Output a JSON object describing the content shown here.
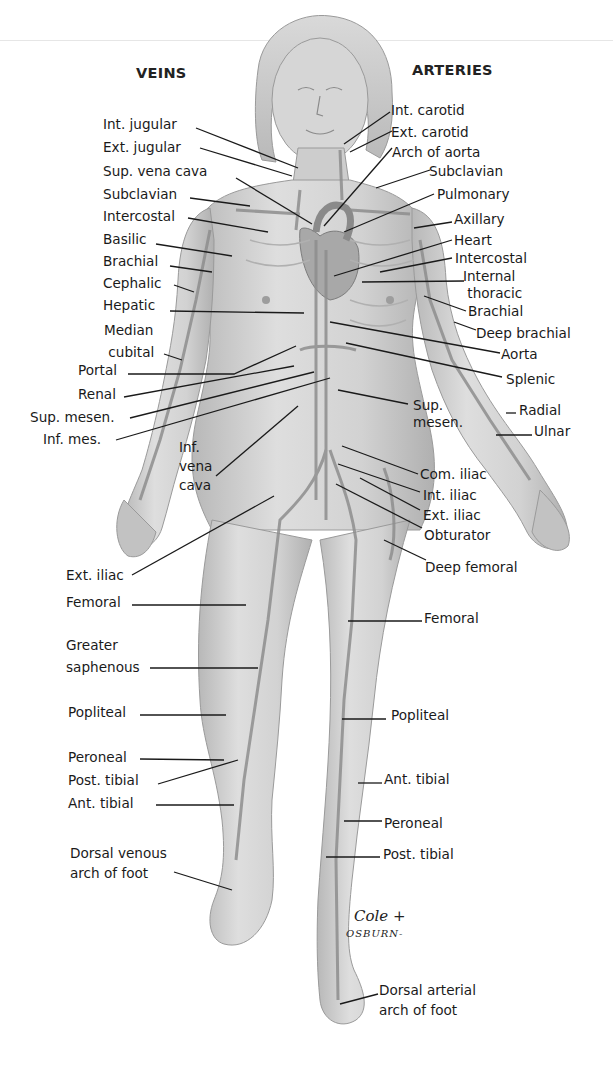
{
  "headers": {
    "veins": "VEINS",
    "arteries": "ARTERIES"
  },
  "colors": {
    "skin": "#c9c9c9",
    "skin_light": "#dcdcdc",
    "vessel": "#8c8c8c",
    "outline": "#9a9a9a",
    "text": "#1a1a1a",
    "background": "#ffffff"
  },
  "veins": [
    {
      "id": "int-jugular",
      "label": "Int. jugular"
    },
    {
      "id": "ext-jugular",
      "label": "Ext. jugular"
    },
    {
      "id": "sup-vena-cava",
      "label": "Sup. vena cava"
    },
    {
      "id": "subclavian",
      "label": "Subclavian"
    },
    {
      "id": "intercostal",
      "label": "Intercostal"
    },
    {
      "id": "basilic",
      "label": "Basilic"
    },
    {
      "id": "brachial",
      "label": "Brachial"
    },
    {
      "id": "cephalic",
      "label": "Cephalic"
    },
    {
      "id": "hepatic",
      "label": "Hepatic"
    },
    {
      "id": "median-cubital",
      "label": "Median\n cubital"
    },
    {
      "id": "portal",
      "label": "Portal"
    },
    {
      "id": "renal",
      "label": "Renal"
    },
    {
      "id": "sup-mesen",
      "label": "Sup. mesen."
    },
    {
      "id": "inf-mes",
      "label": "Inf. mes."
    },
    {
      "id": "inf-vena-cava",
      "label": "Inf.\nvena\ncava"
    },
    {
      "id": "ext-iliac",
      "label": "Ext. iliac"
    },
    {
      "id": "femoral",
      "label": "Femoral"
    },
    {
      "id": "greater-saphenous",
      "label": "Greater\nsaphenous"
    },
    {
      "id": "popliteal",
      "label": "Popliteal"
    },
    {
      "id": "peroneal",
      "label": "Peroneal"
    },
    {
      "id": "post-tibial",
      "label": "Post. tibial"
    },
    {
      "id": "ant-tibial",
      "label": "Ant. tibial"
    },
    {
      "id": "dorsal-venous-arch",
      "label": "Dorsal venous\narch of foot"
    }
  ],
  "arteries": [
    {
      "id": "int-carotid",
      "label": "Int. carotid"
    },
    {
      "id": "ext-carotid",
      "label": "Ext. carotid"
    },
    {
      "id": "arch-of-aorta",
      "label": "Arch of aorta"
    },
    {
      "id": "subclavian",
      "label": "Subclavian"
    },
    {
      "id": "pulmonary",
      "label": "Pulmonary"
    },
    {
      "id": "axillary",
      "label": "Axillary"
    },
    {
      "id": "heart",
      "label": "Heart"
    },
    {
      "id": "intercostal",
      "label": "Intercostal"
    },
    {
      "id": "internal-thoracic",
      "label": "Internal\n thoracic"
    },
    {
      "id": "brachial",
      "label": "Brachial"
    },
    {
      "id": "deep-brachial",
      "label": "Deep brachial"
    },
    {
      "id": "aorta",
      "label": "Aorta"
    },
    {
      "id": "splenic",
      "label": "Splenic"
    },
    {
      "id": "sup-mesen",
      "label": "Sup.\nmesen."
    },
    {
      "id": "radial",
      "label": "Radial"
    },
    {
      "id": "ulnar",
      "label": "Ulnar"
    },
    {
      "id": "com-iliac",
      "label": "Com. iliac"
    },
    {
      "id": "int-iliac",
      "label": "Int. iliac"
    },
    {
      "id": "ext-iliac",
      "label": "Ext. iliac"
    },
    {
      "id": "obturator",
      "label": "Obturator"
    },
    {
      "id": "deep-femoral",
      "label": "Deep femoral"
    },
    {
      "id": "femoral",
      "label": "Femoral"
    },
    {
      "id": "popliteal",
      "label": "Popliteal"
    },
    {
      "id": "ant-tibial",
      "label": "Ant. tibial"
    },
    {
      "id": "peroneal",
      "label": "Peroneal"
    },
    {
      "id": "post-tibial",
      "label": "Post. tibial"
    },
    {
      "id": "dorsal-arterial-arch",
      "label": "Dorsal arterial\narch of foot"
    }
  ],
  "signature": {
    "line1": "Cole +",
    "line2": "OSBURN-"
  }
}
